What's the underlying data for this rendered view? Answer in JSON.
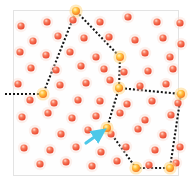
{
  "figure": {
    "title": "",
    "background_color": "#ffffff",
    "plot_background_color": "#fefefe",
    "frame_border_color": "#e3e3e3",
    "width": 193,
    "height": 189,
    "plot_rect": {
      "x": 13,
      "y": 10,
      "width": 166,
      "height": 166
    }
  },
  "legend": {
    "visible": false,
    "entries": []
  },
  "axes": {
    "visible": false,
    "x_ticks": [],
    "y_ticks": [],
    "xlabel": "",
    "ylabel": "",
    "grid": false
  },
  "markers": {
    "point_color": "#ef5436",
    "point_highlight_color": "#f9b9a8",
    "point_radius": 3.6,
    "vertex_color": "#ffb300",
    "vertex_core_color": "#ff7a2f",
    "vertex_radius": 4.0,
    "path_color": "#141414",
    "path_dash": "2 2",
    "path_width": 2.1,
    "arrow_color": "#4dc8e8"
  },
  "chart_data": {
    "type": "scatter",
    "title": "",
    "xlabel": "",
    "ylabel": "",
    "xlim": [
      0,
      193
    ],
    "ylim": [
      0,
      189
    ],
    "grid": false,
    "legend_position": "none",
    "series": [
      {
        "name": "points",
        "color": "#ef5436",
        "marker": "circle",
        "points": [
          [
            21,
            26
          ],
          [
            47,
            22
          ],
          [
            73,
            20
          ],
          [
            100,
            22
          ],
          [
            128,
            17
          ],
          [
            157,
            22
          ],
          [
            180,
            23
          ],
          [
            33,
            41
          ],
          [
            58,
            36
          ],
          [
            84,
            38
          ],
          [
            109,
            37
          ],
          [
            135,
            40
          ],
          [
            163,
            38
          ],
          [
            181,
            44
          ],
          [
            20,
            52
          ],
          [
            46,
            55
          ],
          [
            70,
            52
          ],
          [
            96,
            57
          ],
          [
            145,
            53
          ],
          [
            170,
            57
          ],
          [
            31,
            68
          ],
          [
            56,
            70
          ],
          [
            81,
            66
          ],
          [
            104,
            69
          ],
          [
            124,
            72
          ],
          [
            148,
            71
          ],
          [
            173,
            69
          ],
          [
            18,
            84
          ],
          [
            60,
            85
          ],
          [
            86,
            83
          ],
          [
            110,
            80
          ],
          [
            140,
            86
          ],
          [
            166,
            84
          ],
          [
            30,
            100
          ],
          [
            54,
            103
          ],
          [
            78,
            100
          ],
          [
            100,
            101
          ],
          [
            127,
            104
          ],
          [
            152,
            101
          ],
          [
            178,
            103
          ],
          [
            22,
            117
          ],
          [
            48,
            113
          ],
          [
            72,
            118
          ],
          [
            96,
            116
          ],
          [
            120,
            113
          ],
          [
            145,
            120
          ],
          [
            171,
            115
          ],
          [
            35,
            131
          ],
          [
            61,
            134
          ],
          [
            88,
            130
          ],
          [
            111,
            134
          ],
          [
            138,
            129
          ],
          [
            163,
            135
          ],
          [
            24,
            148
          ],
          [
            50,
            150
          ],
          [
            76,
            147
          ],
          [
            101,
            152
          ],
          [
            126,
            147
          ],
          [
            155,
            150
          ],
          [
            180,
            147
          ],
          [
            40,
            164
          ],
          [
            66,
            162
          ],
          [
            92,
            166
          ],
          [
            117,
            161
          ],
          [
            149,
            165
          ],
          [
            176,
            163
          ]
        ]
      },
      {
        "name": "path-vertices",
        "color": "#ffb300",
        "marker": "circle-highlight",
        "points": [
          [
            43,
            94
          ],
          [
            76,
            11
          ],
          [
            120,
            57
          ],
          [
            119,
            88
          ],
          [
            181,
            94
          ],
          [
            170,
            168
          ],
          [
            136,
            168
          ],
          [
            107,
            128
          ]
        ]
      }
    ],
    "paths": [
      {
        "name": "dotted-boundary-path",
        "color": "#141414",
        "style": "dotted",
        "closed": false,
        "vertices": [
          [
            5,
            94
          ],
          [
            43,
            94
          ],
          [
            76,
            11
          ],
          [
            120,
            57
          ],
          [
            119,
            88
          ],
          [
            181,
            94
          ],
          [
            170,
            168
          ],
          [
            136,
            168
          ],
          [
            107,
            128
          ],
          [
            119,
            88
          ]
        ]
      }
    ],
    "annotations": [
      {
        "name": "cyan-arrow",
        "type": "arrow",
        "color": "#4dc8e8",
        "from": [
          86,
          143
        ],
        "to": [
          100,
          133
        ]
      }
    ]
  }
}
